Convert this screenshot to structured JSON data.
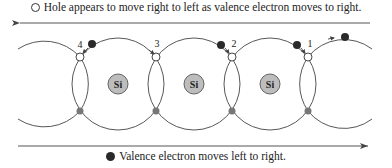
{
  "captions": {
    "top": "Hole appears to move right to left as valence electron moves to right.",
    "bottom": "Valence electron moves left to right."
  },
  "legend": {
    "hole_symbol": "open-circle",
    "electron_symbol": "filled-circle"
  },
  "atoms": [
    {
      "label": "Si"
    },
    {
      "label": "Si"
    },
    {
      "label": "Si"
    }
  ],
  "bond_labels": [
    "4",
    "3",
    "2",
    "1"
  ],
  "arrows": {
    "top_direction": "left",
    "bottom_direction": "right"
  },
  "colors": {
    "line": "#444444",
    "atom_fill": "#bdbdbd",
    "electron": "#2a2a2a",
    "background": "#ffffff"
  }
}
